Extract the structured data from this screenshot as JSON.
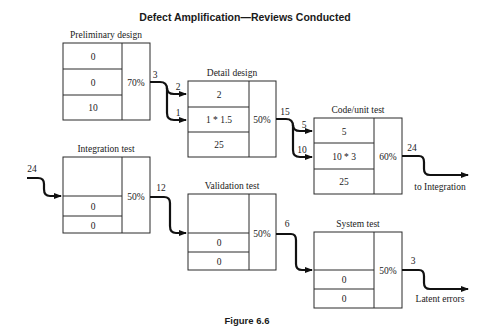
{
  "title": "Defect Amplification—Reviews Conducted",
  "caption": "Figure 6.6",
  "steps": [
    {
      "id": "preliminary",
      "name": "Preliminary design",
      "cells": [
        "0",
        "0",
        "10"
      ],
      "efficiency": "70%",
      "out": "3"
    },
    {
      "id": "detail",
      "name": "Detail design",
      "cells": [
        "2",
        "1 * 1.5",
        "25"
      ],
      "efficiency": "50%",
      "in": [
        "2",
        "1"
      ],
      "out": "15"
    },
    {
      "id": "code",
      "name": "Code/unit test",
      "cells": [
        "5",
        "10 * 3",
        "25"
      ],
      "efficiency": "60%",
      "in": [
        "5",
        "10"
      ],
      "out": "24",
      "out_label": "to Integration"
    },
    {
      "id": "integration",
      "name": "Integration test",
      "cells": [
        "",
        "0",
        "0"
      ],
      "efficiency": "50%",
      "in": [
        "24"
      ],
      "out": "12"
    },
    {
      "id": "validation",
      "name": "Validation test",
      "cells": [
        "",
        "0",
        "0"
      ],
      "efficiency": "50%",
      "out": "6"
    },
    {
      "id": "system",
      "name": "System test",
      "cells": [
        "",
        "0",
        "0"
      ],
      "efficiency": "50%",
      "out": "3",
      "out_label": "Latent errors"
    }
  ]
}
